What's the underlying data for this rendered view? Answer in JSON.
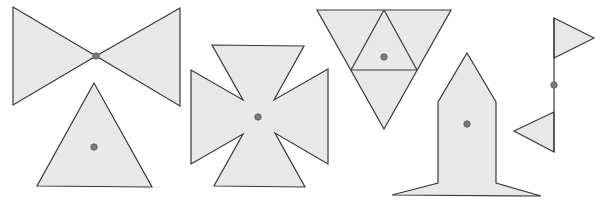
{
  "figure": {
    "colors": {
      "fill": "#e8e8e8",
      "stroke": "#3a3a3a",
      "dot": "#7a7a7a",
      "background": "#ffffff"
    },
    "shapes": [
      {
        "id": "bowtie",
        "label": "Bow tie",
        "polygons": [
          "13,7 96,56 13,105",
          "180,8 96,56 180,106"
        ],
        "dot": [
          96,
          56
        ]
      },
      {
        "id": "triangle",
        "label": "Equilateral triangle",
        "polygons": [
          "94,83 152,187 37,186"
        ],
        "dot": [
          94,
          147
        ]
      },
      {
        "id": "maltese-cross",
        "label": "Maltese cross",
        "polygons": [
          "212,45 304,46 274,100 328,69 328,164 275,133 305,187 214,186 243,134 191,164 191,70 243,100"
        ],
        "dot": [
          258,
          117
        ]
      },
      {
        "id": "subdivided-triangle",
        "label": "Inverted triangle subdivided into four",
        "polygons": [
          "317,10 451,10 384,129"
        ],
        "lines": [
          "384,10 351,70",
          "384,10 417,70",
          "351,70 417,70"
        ],
        "dot": [
          384,
          57
        ]
      },
      {
        "id": "rocket",
        "label": "Rocket / house shape",
        "polygons": [
          "467,53 496,102 496,183 541,196 392,195 438,183 438,102"
        ],
        "dot": [
          467,
          124
        ]
      },
      {
        "id": "flags",
        "label": "Pole with two flags",
        "polygons": [
          "554,18 594,38 554,58",
          "554,112 514,131 554,152"
        ],
        "lines": [
          "554,18 554,152"
        ],
        "dot": [
          554,
          85
        ]
      }
    ]
  }
}
